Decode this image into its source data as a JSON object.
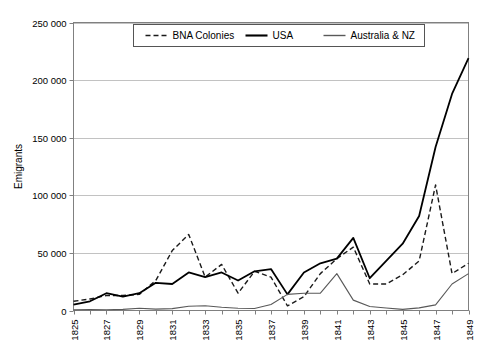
{
  "chart_data": {
    "type": "line",
    "title": "",
    "xlabel": "",
    "ylabel": "Emigrants",
    "ylim": [
      0,
      250000
    ],
    "ytick_labels": [
      "250 000",
      "200 000",
      "150 000",
      "100 000",
      "50 000",
      "0"
    ],
    "ytick_values": [
      250000,
      200000,
      150000,
      100000,
      50000,
      0
    ],
    "grid": true,
    "legend_position": "top-center",
    "x": [
      1825,
      1826,
      1827,
      1828,
      1829,
      1830,
      1831,
      1832,
      1833,
      1834,
      1835,
      1836,
      1837,
      1838,
      1839,
      1840,
      1841,
      1842,
      1843,
      1844,
      1845,
      1846,
      1847,
      1848,
      1849
    ],
    "xtick_labels": [
      "1825",
      "1827",
      "1829",
      "1831",
      "1833",
      "1835",
      "1837",
      "1839",
      "1841",
      "1843",
      "1845",
      "1847",
      "1849"
    ],
    "xtick_values": [
      1825,
      1827,
      1829,
      1831,
      1833,
      1835,
      1837,
      1839,
      1841,
      1843,
      1845,
      1847,
      1849
    ],
    "series": [
      {
        "name": "BNA Colonies",
        "style": "dashed",
        "color": "#1a1a1a",
        "width": 1.4,
        "values": [
          8000,
          10000,
          13000,
          13000,
          14000,
          26000,
          52000,
          66000,
          29000,
          40000,
          15000,
          34000,
          29000,
          4000,
          12000,
          32000,
          45000,
          55000,
          23000,
          23000,
          31000,
          43000,
          109000,
          32000,
          41000
        ]
      },
      {
        "name": "USA",
        "style": "solid",
        "color": "#000000",
        "width": 1.8,
        "values": [
          5000,
          8000,
          15000,
          12000,
          15000,
          24000,
          23000,
          33000,
          29000,
          33000,
          26000,
          34000,
          36000,
          14000,
          33000,
          41000,
          45000,
          63000,
          28000,
          43000,
          58000,
          82000,
          142000,
          188000,
          219000
        ]
      },
      {
        "name": "Australia & NZ",
        "style": "solid",
        "color": "#595959",
        "width": 1.1,
        "values": [
          500,
          900,
          700,
          1000,
          2000,
          1200,
          1600,
          3700,
          4100,
          2800,
          1900,
          1800,
          5200,
          14000,
          15000,
          15000,
          32000,
          9000,
          3500,
          2200,
          1000,
          2300,
          4900,
          23000,
          32000
        ]
      }
    ]
  },
  "legend": {
    "items": [
      {
        "label": "BNA Colonies"
      },
      {
        "label": "USA"
      },
      {
        "label": "Australia & NZ"
      }
    ]
  }
}
